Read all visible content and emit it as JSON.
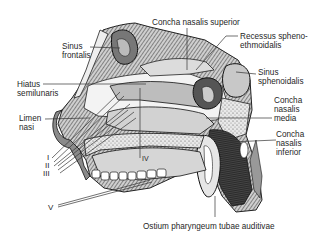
{
  "figure": {
    "labels": {
      "concha_superior": "Concha nasalis superior",
      "recessus": "Recessus spheno-\nethmoidalis",
      "sinus_frontalis": "Sinus\nfrontalis",
      "sinus_sphenoidalis": "Sinus\nsphenoidalis",
      "hiatus": "Hiatus\nsemilunaris",
      "concha_media": "Concha\nnasalis\nmedia",
      "limen": "Limen\nnasi",
      "concha_inferior": "Concha\nnasalis\ninferior",
      "ostium": "Ostium pharyngeum tubae auditivae"
    },
    "roman_markers": {
      "i": "I",
      "ii": "II",
      "iii": "III",
      "iv": "IV",
      "v": "V"
    }
  }
}
